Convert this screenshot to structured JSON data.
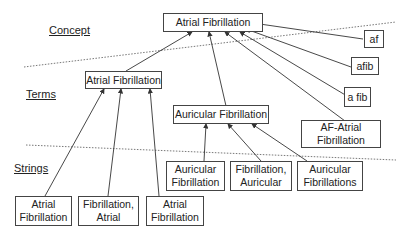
{
  "levels": {
    "concept": "Concept",
    "terms": "Terms",
    "strings": "Strings"
  },
  "concept": {
    "label": "Atrial Fibrillation"
  },
  "synonyms": [
    {
      "label": "af"
    },
    {
      "label": "afib"
    },
    {
      "label": "a fib"
    },
    {
      "line1": "AF-Atrial",
      "line2": "Fibrillation"
    }
  ],
  "terms": [
    {
      "label": "Atrial Fibrillation"
    },
    {
      "label": "Auricular Fibrillation"
    }
  ],
  "strings": [
    {
      "line1": "Atrial",
      "line2": "Fibrillation"
    },
    {
      "line1": "Fibrillation,",
      "line2": "Atrial"
    },
    {
      "line1": "Atrial",
      "line2": "Fibrillation"
    },
    {
      "line1": "Auricular",
      "line2": "Fibrillation"
    },
    {
      "line1": "Fibrillation,",
      "line2": "Auricular"
    },
    {
      "line1": "Auricular",
      "line2": "Fibrillations"
    }
  ]
}
